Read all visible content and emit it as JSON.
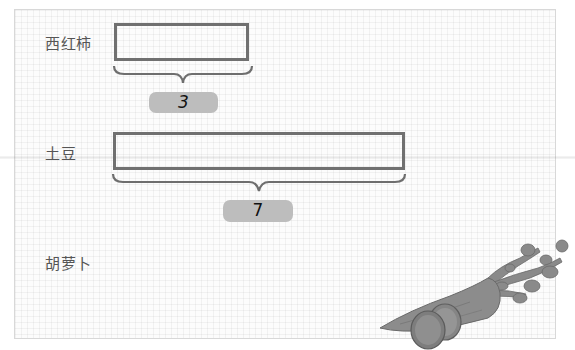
{
  "rows": [
    {
      "label": "西红柿",
      "value": "3"
    },
    {
      "label": "土豆",
      "value": "7"
    },
    {
      "label": "胡萝卜",
      "value": ""
    }
  ],
  "colors": {
    "bar_border": "#707070",
    "brace": "#6e6e6e",
    "badge_fill": "#bdbdbd",
    "label_text": "#555555"
  },
  "illustration": "carrot-with-slices"
}
